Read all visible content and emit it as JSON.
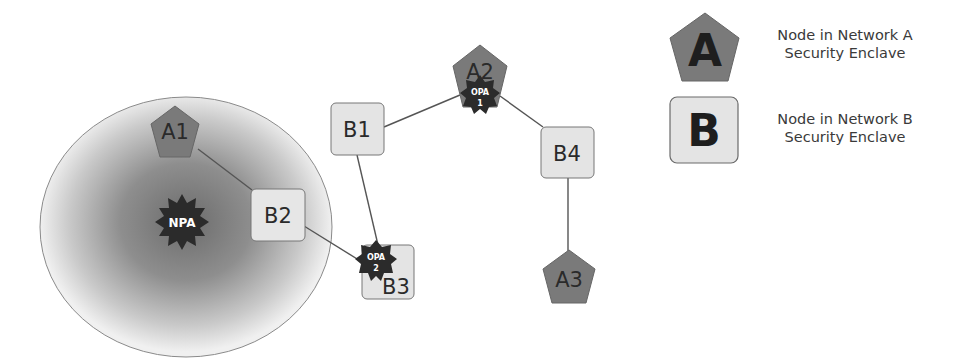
{
  "colors": {
    "network_a_fill": "#7a7a7a",
    "network_b_fill": "#e4e4e4",
    "badge_fill": "#2b2b2b",
    "edge": "#555555",
    "enclave_center": "#6e6e6e",
    "enclave_edge": "#efefef"
  },
  "enclave": {
    "label": "NPA"
  },
  "nodes": {
    "A1": {
      "label": "A1",
      "network": "A"
    },
    "A2": {
      "label": "A2",
      "network": "A"
    },
    "A3": {
      "label": "A3",
      "network": "A"
    },
    "B1": {
      "label": "B1",
      "network": "B"
    },
    "B2": {
      "label": "B2",
      "network": "B"
    },
    "B3": {
      "label": "B3",
      "network": "B"
    },
    "B4": {
      "label": "B4",
      "network": "B"
    }
  },
  "badges": {
    "npa": {
      "line1": "NPA"
    },
    "opa1": {
      "line1": "OPA",
      "line2": "1",
      "attached_to": "A2"
    },
    "opa2": {
      "line1": "OPA",
      "line2": "2",
      "attached_to": "B3"
    }
  },
  "edges": [
    {
      "from": "A1",
      "to": "B2"
    },
    {
      "from": "B2",
      "to": "B3"
    },
    {
      "from": "B1",
      "to": "B3"
    },
    {
      "from": "B1",
      "to": "A2"
    },
    {
      "from": "A2",
      "to": "B4"
    },
    {
      "from": "B4",
      "to": "A3"
    }
  ],
  "legend": {
    "a": {
      "symbol": "A",
      "line1": "Node in Network A",
      "line2": "Security Enclave"
    },
    "b": {
      "symbol": "B",
      "line1": "Node in Network B",
      "line2": "Security Enclave"
    }
  }
}
